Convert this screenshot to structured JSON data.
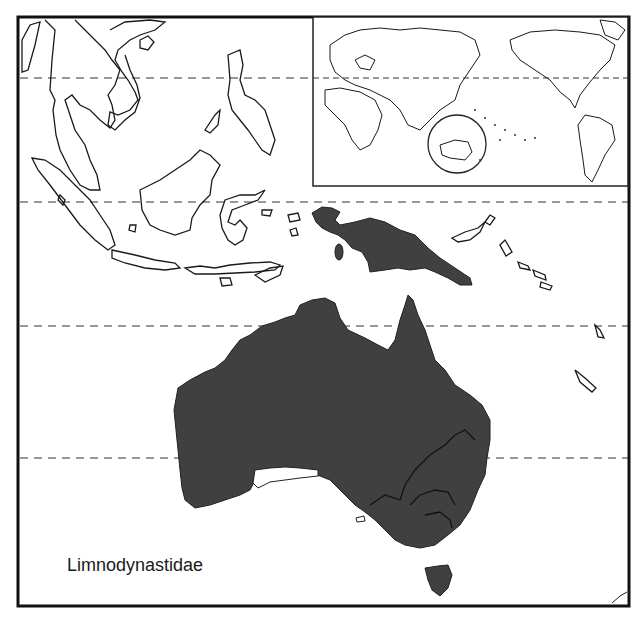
{
  "map": {
    "title": "Limnodynastidae",
    "region": "Southeast Asia and Australasia",
    "range_color": "#404040",
    "outline_color": "#1a1a1a",
    "background_color": "#ffffff",
    "gridlines": {
      "style": "dashed",
      "count": 4
    },
    "inset": {
      "description": "World map with circle highlighting Australia",
      "highlight_shape": "circle"
    },
    "legend": {
      "label": "Limnodynastidae"
    }
  }
}
